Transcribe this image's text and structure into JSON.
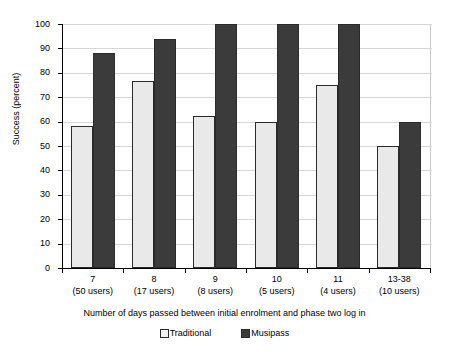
{
  "chart_data": {
    "type": "bar",
    "title": "",
    "xlabel": "Number of days passed between initial enrolment and phase two log in",
    "ylabel": "Success (percent)",
    "ylim": [
      0,
      100
    ],
    "ytick_step": 10,
    "grid": true,
    "legend_position": "bottom",
    "categories": [
      "7\n(50 users)",
      "8\n(17 users)",
      "9\n(8 users)",
      "10\n(5 users)",
      "11\n(4 users)",
      "13-38\n(10 users)"
    ],
    "category_parts": [
      {
        "days": "7",
        "users": "(50 users)"
      },
      {
        "days": "8",
        "users": "(17 users)"
      },
      {
        "days": "9",
        "users": "(8 users)"
      },
      {
        "days": "10",
        "users": "(5 users)"
      },
      {
        "days": "11",
        "users": "(4 users)"
      },
      {
        "days": "13-38",
        "users": "(10 users)"
      }
    ],
    "series": [
      {
        "name": "Traditional",
        "color": "#e9e9e9",
        "values": [
          58,
          76.5,
          62.5,
          60,
          75,
          50
        ]
      },
      {
        "name": "Musipass",
        "color": "#3b3b3b",
        "values": [
          88,
          94,
          100,
          100,
          100,
          60
        ]
      }
    ],
    "ytick_labels": [
      "0",
      "10",
      "20",
      "30",
      "40",
      "50",
      "60",
      "70",
      "80",
      "90",
      "100"
    ]
  },
  "axes": {
    "y_title": "Success (percent)",
    "x_title": "Number of days passed between initial enrolment and phase two log in"
  },
  "legend": {
    "items": [
      {
        "label": "Traditional",
        "swatch": "light-square-icon"
      },
      {
        "label": "Musipass",
        "swatch": "dark-square-icon"
      }
    ]
  }
}
